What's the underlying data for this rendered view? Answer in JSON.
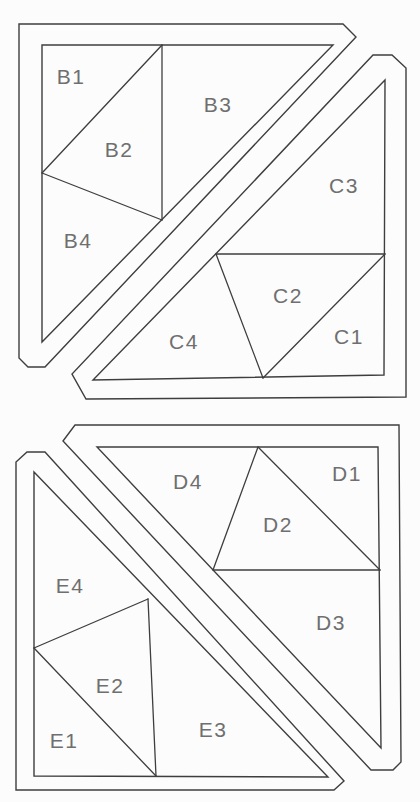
{
  "diagram": {
    "colors": {
      "background": "#fcfcfc",
      "line": "#3e3e3e",
      "label": "#6f6f6f"
    },
    "units": [
      {
        "id": "B",
        "outline": "19,24 343,24 356,37 45,367 28,367 19,358",
        "triangle": "42,45 333,45 42,342",
        "seams": [
          "162,45 162,220",
          "42,173 162,45",
          "42,173 162,220"
        ],
        "labels": [
          {
            "text": "B1",
            "x": 71,
            "y": 76
          },
          {
            "text": "B2",
            "x": 119,
            "y": 149
          },
          {
            "text": "B3",
            "x": 218,
            "y": 104
          },
          {
            "text": "B4",
            "x": 78,
            "y": 240
          }
        ]
      },
      {
        "id": "C",
        "outline": "86,399 406,397 406,68 392,55 373,55 72,374",
        "triangle": "385,80 384,375 93,380",
        "seams": [
          "216,254 385,254",
          "216,254 263,378",
          "263,378 385,254"
        ],
        "labels": [
          {
            "text": "C1",
            "x": 349,
            "y": 336
          },
          {
            "text": "C2",
            "x": 288,
            "y": 295
          },
          {
            "text": "C3",
            "x": 344,
            "y": 185
          },
          {
            "text": "C4",
            "x": 184,
            "y": 341
          }
        ]
      },
      {
        "id": "D",
        "outline": "75,425 399,425 401,762 393,770 371,770 63,441",
        "triangle": "97,447 378,447 381,748",
        "seams": [
          "258,447 380,570",
          "258,447 213,570",
          "213,570 380,570"
        ],
        "labels": [
          {
            "text": "D1",
            "x": 347,
            "y": 473
          },
          {
            "text": "D2",
            "x": 278,
            "y": 524
          },
          {
            "text": "D3",
            "x": 331,
            "y": 622
          },
          {
            "text": "D4",
            "x": 188,
            "y": 481
          }
        ]
      },
      {
        "id": "E",
        "outline": "16,790 16,462 27,452 45,452 344,781 334,790",
        "triangle": "34,472 34,776 328,777",
        "seams": [
          "148,599 156,776",
          "34,648 148,599",
          "34,648 156,776"
        ],
        "labels": [
          {
            "text": "E1",
            "x": 64,
            "y": 740
          },
          {
            "text": "E2",
            "x": 110,
            "y": 685
          },
          {
            "text": "E3",
            "x": 213,
            "y": 729
          },
          {
            "text": "E4",
            "x": 70,
            "y": 585
          }
        ]
      }
    ]
  }
}
